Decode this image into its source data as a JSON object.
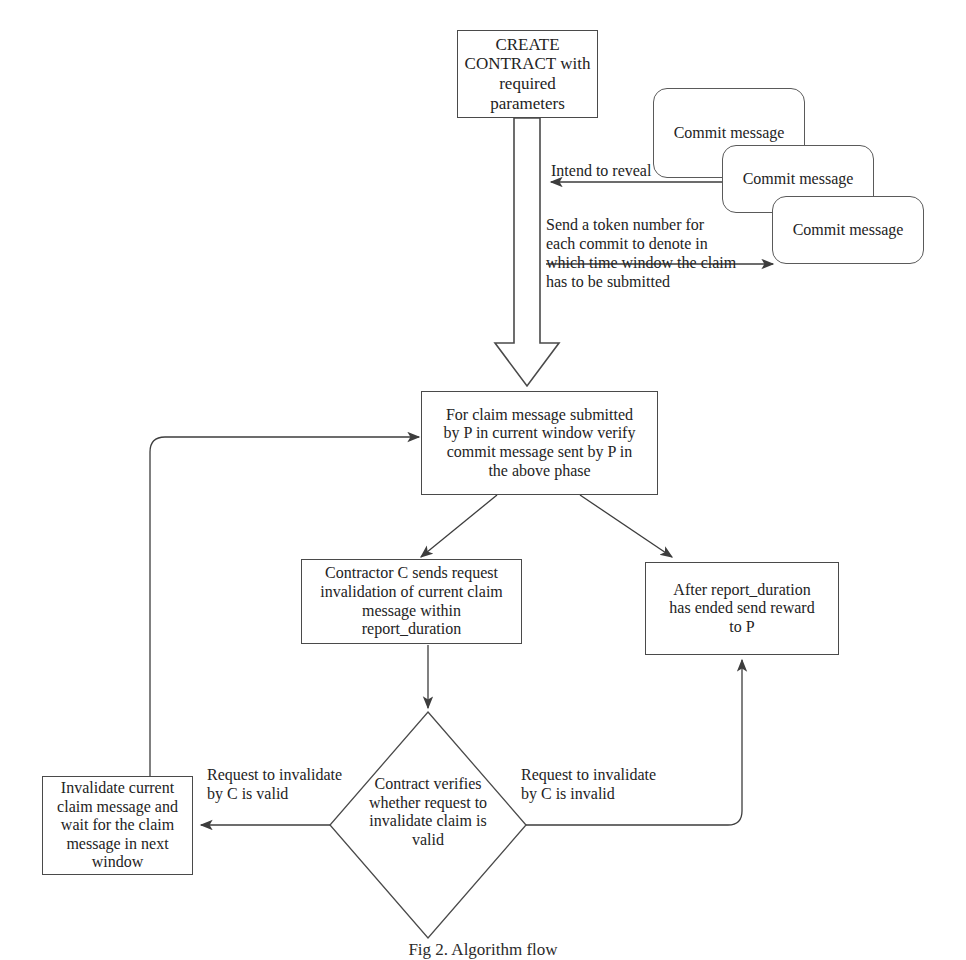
{
  "diagram": {
    "caption": "Fig 2. Algorithm flow",
    "stroke_color": "#4a4a4a",
    "text_color": "#232323",
    "background": "#ffffff"
  },
  "nodes": {
    "create_contract": {
      "id": "create-contract",
      "shape": "rect",
      "text": "CREATE\nCONTRACT with\nrequired\nparameters"
    },
    "commit_message_1": {
      "id": "commit-message-1",
      "shape": "rounded",
      "text": "Commit message"
    },
    "commit_message_2": {
      "id": "commit-message-2",
      "shape": "rounded",
      "text": "Commit message"
    },
    "commit_message_3": {
      "id": "commit-message-3",
      "shape": "rounded",
      "text": "Commit message"
    },
    "verify_claim": {
      "id": "verify-claim",
      "shape": "rect",
      "text": "For claim message submitted\nby P in current window verify\ncommit message sent by P in\nthe above phase"
    },
    "contractor_request": {
      "id": "contractor-request",
      "shape": "rect",
      "text": "Contractor C sends request\ninvalidation of current claim\nmessage within\nreport_duration"
    },
    "send_reward": {
      "id": "send-reward",
      "shape": "rect",
      "text": "After report_duration\nhas ended send reward\nto P"
    },
    "contract_verifies": {
      "id": "contract-verifies",
      "shape": "diamond",
      "text": "Contract verifies\nwhether request to\ninvalidate claim is\nvalid"
    },
    "invalidate_claim": {
      "id": "invalidate-claim",
      "shape": "rect",
      "text": "Invalidate current\nclaim message and\nwait for the claim\nmessage in next\nwindow"
    }
  },
  "edge_labels": {
    "intend_to_reveal": "Intend to reveal",
    "send_token": "Send a token number for\neach commit to denote in\nwhich time window the claim\nhas to be submitted",
    "valid": "Request to invalidate\nby C is valid",
    "invalid": "Request to invalidate\nby C is invalid"
  }
}
